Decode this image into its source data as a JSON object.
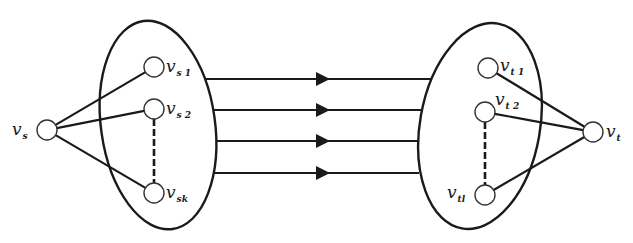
{
  "diagram": {
    "type": "flow-network-cut",
    "source": {
      "id": "v_s",
      "label": "v",
      "sub": "s",
      "x": 47,
      "y": 130
    },
    "sink": {
      "id": "v_t",
      "label": "v",
      "sub": "t",
      "x": 593,
      "y": 132
    },
    "left_set": {
      "ellipse": {
        "cx": 158,
        "cy": 125,
        "rx": 57,
        "ry": 105,
        "rotate": -8
      },
      "nodes": [
        {
          "id": "v_s1",
          "label": "v",
          "sub": "s 1",
          "x": 154,
          "y": 67
        },
        {
          "id": "v_s2",
          "label": "v",
          "sub": "s 2",
          "x": 154,
          "y": 109
        },
        {
          "id": "v_sk",
          "label": "v",
          "sub": "sk",
          "x": 154,
          "y": 193
        }
      ],
      "dashed_between": [
        "v_s2",
        "v_sk"
      ]
    },
    "right_set": {
      "ellipse": {
        "cx": 480,
        "cy": 126,
        "rx": 60,
        "ry": 104,
        "rotate": 10
      },
      "nodes": [
        {
          "id": "v_t1",
          "label": "v",
          "sub": "t 1",
          "x": 488,
          "y": 68
        },
        {
          "id": "v_t2",
          "label": "v",
          "sub": "t 2",
          "x": 485,
          "y": 112
        },
        {
          "id": "v_tl",
          "label": "v",
          "sub": "tl",
          "x": 485,
          "y": 195
        }
      ],
      "dashed_between": [
        "v_t2",
        "v_tl"
      ]
    },
    "cross_edges": [
      {
        "y": 79,
        "x1": 205,
        "x2": 432,
        "arrow_x": 322
      },
      {
        "y": 110,
        "x1": 213,
        "x2": 423,
        "arrow_x": 322
      },
      {
        "y": 141,
        "x1": 216,
        "x2": 418,
        "arrow_x": 322
      },
      {
        "y": 173,
        "x1": 214,
        "x2": 419,
        "arrow_x": 322
      }
    ],
    "source_edges": [
      "v_s1",
      "v_s2",
      "v_sk"
    ],
    "sink_edges": [
      "v_t1",
      "v_t2",
      "v_tl"
    ],
    "colors": {
      "line": "#1a1a1a",
      "node_fill": "#ffffff",
      "background": "#ffffff"
    }
  }
}
